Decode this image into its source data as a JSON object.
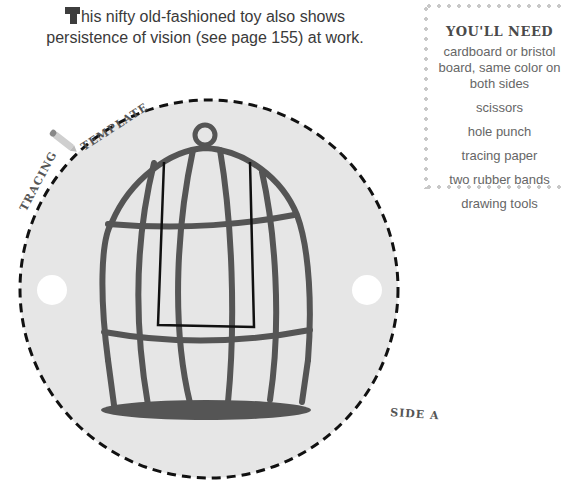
{
  "intro": {
    "drop_cap": "T",
    "text": "his nifty old-fashioned toy also shows persistence of vision (see page 155) at work."
  },
  "needs": {
    "title": "YOU'LL NEED",
    "items": [
      "cardboard or bristol board, same color on both sides",
      "scissors",
      "hole punch",
      "tracing paper",
      "two rubber bands",
      "drawing tools"
    ]
  },
  "template": {
    "label_tracing": "TRACING",
    "label_template": "TEMPLATE",
    "side_label": "SIDE A",
    "icon": "pencil-icon",
    "colors": {
      "disc_fill": "#e6e6e6",
      "cage_stroke": "#555555",
      "dash": "#111111",
      "hole": "#ffffff"
    }
  }
}
